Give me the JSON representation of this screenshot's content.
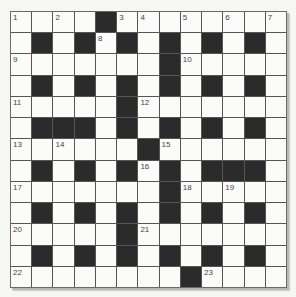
{
  "puzzle": {
    "type": "crossword",
    "rows": 13,
    "cols": 13,
    "colors": {
      "background": "#f6f6f4",
      "cell_white": "#fbfbfa",
      "cell_black": "#2b2b2b",
      "grid_line": "#555555",
      "number_text": "#444444"
    },
    "layout": [
      "....#........",
      ".#.#.#.#.#.#.",
      ".......#.....",
      ".#.#.#.#.#.#.",
      ".....#.......",
      ".###.#.#.#.#.",
      "......#......",
      ".#.#.#.#.###.",
      ".......#.....",
      ".#.#.#.#.#.#.",
      ".....#.......",
      ".#.#.#.#.#.#.",
      "........#...."
    ],
    "numbers": [
      {
        "row": 0,
        "col": 0,
        "n": "1"
      },
      {
        "row": 0,
        "col": 2,
        "n": "2"
      },
      {
        "row": 0,
        "col": 5,
        "n": "3"
      },
      {
        "row": 0,
        "col": 6,
        "n": "4"
      },
      {
        "row": 0,
        "col": 8,
        "n": "5"
      },
      {
        "row": 0,
        "col": 10,
        "n": "6"
      },
      {
        "row": 0,
        "col": 12,
        "n": "7"
      },
      {
        "row": 1,
        "col": 4,
        "n": "8"
      },
      {
        "row": 2,
        "col": 0,
        "n": "9"
      },
      {
        "row": 2,
        "col": 8,
        "n": "10"
      },
      {
        "row": 4,
        "col": 0,
        "n": "11"
      },
      {
        "row": 4,
        "col": 6,
        "n": "12"
      },
      {
        "row": 6,
        "col": 0,
        "n": "13"
      },
      {
        "row": 6,
        "col": 2,
        "n": "14"
      },
      {
        "row": 6,
        "col": 7,
        "n": "15"
      },
      {
        "row": 7,
        "col": 6,
        "n": "16"
      },
      {
        "row": 8,
        "col": 0,
        "n": "17"
      },
      {
        "row": 8,
        "col": 8,
        "n": "18"
      },
      {
        "row": 8,
        "col": 10,
        "n": "19"
      },
      {
        "row": 10,
        "col": 0,
        "n": "20"
      },
      {
        "row": 10,
        "col": 6,
        "n": "21"
      },
      {
        "row": 12,
        "col": 0,
        "n": "22"
      },
      {
        "row": 12,
        "col": 9,
        "n": "23"
      }
    ]
  }
}
